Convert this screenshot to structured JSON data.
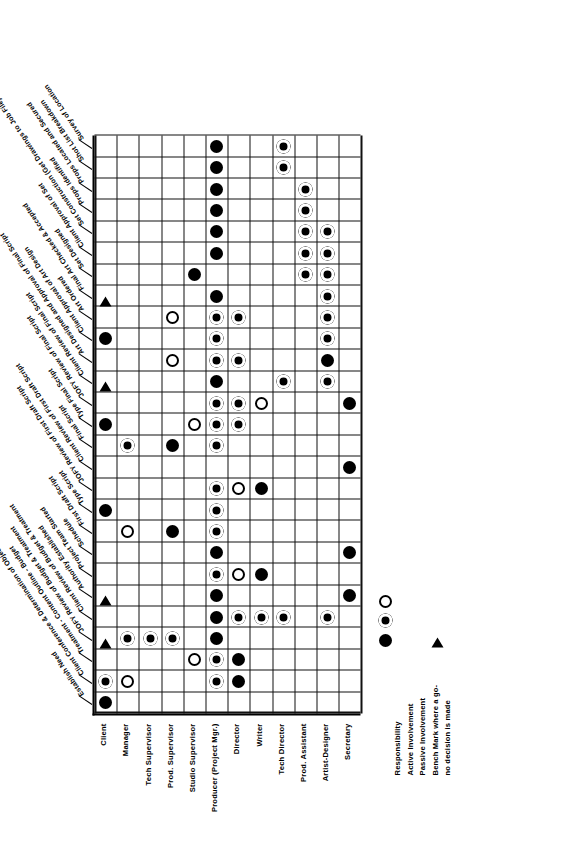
{
  "document": {
    "kind": "linear-responsibility-chart",
    "orientation": "rotated-90-ccw"
  },
  "legend": {
    "items": [
      {
        "symbol": "filled-circle",
        "label": "Responsibility"
      },
      {
        "symbol": "dotted-circle",
        "label": "Active Involvement"
      },
      {
        "symbol": "open-circle",
        "label": "Passive Involvement"
      },
      {
        "symbol": "triangle",
        "label": "Bench Mark where a go-"
      },
      {
        "symbol": "none",
        "label": "no decision is made"
      }
    ]
  },
  "roles": [
    "Client",
    "Manager",
    "Tech Supervisor",
    "Prod. Supervisor",
    "Studio Supervisor",
    "Producer (Project Mgr.)",
    "Director",
    "Writer",
    "Tech Director",
    "Prod. Assistant",
    "Artist-Designer",
    "Secretary"
  ],
  "tasks": [
    "Establish Need",
    "Client Conference & Determination of Objectives",
    "Treatment - Content Outline - Budget",
    "JOFY Review of Budget & Treatment",
    "Client Review of Budget & Treatment",
    "Authority Established",
    "Project Team Started",
    "Schedule",
    "First Draft Script",
    "Type Script",
    "JOFY Review of First Draft Script",
    "Client Review of First Draft Script",
    "Final Script",
    "Type Final Script",
    "JOFY Review of Final Script",
    "Client Review of Final Script",
    "Art Designed and Approval of Final Script",
    "Client Approval of Art Design",
    "Art Ordered",
    "Final Art Checked & Accepted",
    "Set Designed",
    "Client Approval of Set",
    "Set Construction (Get Drawings to Job File)",
    "Props Identified",
    "Props Located and Secured",
    "Shot List Breakdown",
    "Survey of Location"
  ],
  "chart_data": {
    "type": "table",
    "xlabel": "Task",
    "ylabel": "Role",
    "symbol_key": {
      "R": "Responsibility",
      "A": "Active Involvement",
      "P": "Passive Involvement",
      "B": "Bench Mark where a go-no go decision is made"
    },
    "cells": [
      {
        "task": 0,
        "role": 0,
        "mark": "R"
      },
      {
        "task": 1,
        "role": 0,
        "mark": "A"
      },
      {
        "task": 1,
        "role": 1,
        "mark": "P"
      },
      {
        "task": 1,
        "role": 5,
        "mark": "A"
      },
      {
        "task": 1,
        "role": 6,
        "mark": "R"
      },
      {
        "task": 2,
        "role": 5,
        "mark": "A"
      },
      {
        "task": 2,
        "role": 6,
        "mark": "R"
      },
      {
        "task": 2,
        "role": 4,
        "mark": "P"
      },
      {
        "task": 3,
        "role": 0,
        "mark": "B"
      },
      {
        "task": 3,
        "role": 1,
        "mark": "A"
      },
      {
        "task": 3,
        "role": 2,
        "mark": "A"
      },
      {
        "task": 3,
        "role": 3,
        "mark": "A"
      },
      {
        "task": 3,
        "role": 5,
        "mark": "R"
      },
      {
        "task": 4,
        "role": 5,
        "mark": "R"
      },
      {
        "task": 4,
        "role": 6,
        "mark": "A"
      },
      {
        "task": 4,
        "role": 7,
        "mark": "A"
      },
      {
        "task": 4,
        "role": 8,
        "mark": "A"
      },
      {
        "task": 4,
        "role": 10,
        "mark": "A"
      },
      {
        "task": 5,
        "role": 0,
        "mark": "B"
      },
      {
        "task": 5,
        "role": 5,
        "mark": "R"
      },
      {
        "task": 5,
        "role": 11,
        "mark": "R"
      },
      {
        "task": 6,
        "role": 5,
        "mark": "A"
      },
      {
        "task": 6,
        "role": 6,
        "mark": "P"
      },
      {
        "task": 6,
        "role": 7,
        "mark": "R"
      },
      {
        "task": 7,
        "role": 5,
        "mark": "R"
      },
      {
        "task": 7,
        "role": 11,
        "mark": "R"
      },
      {
        "task": 8,
        "role": 5,
        "mark": "A"
      },
      {
        "task": 8,
        "role": 3,
        "mark": "R"
      },
      {
        "task": 8,
        "role": 1,
        "mark": "P"
      },
      {
        "task": 9,
        "role": 5,
        "mark": "A"
      },
      {
        "task": 9,
        "role": 0,
        "mark": "R"
      },
      {
        "task": 10,
        "role": 5,
        "mark": "A"
      },
      {
        "task": 10,
        "role": 6,
        "mark": "P"
      },
      {
        "task": 10,
        "role": 7,
        "mark": "R"
      },
      {
        "task": 11,
        "role": 11,
        "mark": "R"
      },
      {
        "task": 12,
        "role": 5,
        "mark": "A"
      },
      {
        "task": 12,
        "role": 3,
        "mark": "R"
      },
      {
        "task": 12,
        "role": 1,
        "mark": "A"
      },
      {
        "task": 13,
        "role": 0,
        "mark": "R"
      },
      {
        "task": 13,
        "role": 5,
        "mark": "A"
      },
      {
        "task": 13,
        "role": 4,
        "mark": "P"
      },
      {
        "task": 13,
        "role": 6,
        "mark": "A"
      },
      {
        "task": 14,
        "role": 5,
        "mark": "A"
      },
      {
        "task": 14,
        "role": 6,
        "mark": "A"
      },
      {
        "task": 14,
        "role": 7,
        "mark": "P"
      },
      {
        "task": 14,
        "role": 11,
        "mark": "R"
      },
      {
        "task": 15,
        "role": 0,
        "mark": "B"
      },
      {
        "task": 15,
        "role": 5,
        "mark": "R"
      },
      {
        "task": 15,
        "role": 8,
        "mark": "A"
      },
      {
        "task": 15,
        "role": 10,
        "mark": "A"
      },
      {
        "task": 16,
        "role": 3,
        "mark": "P"
      },
      {
        "task": 16,
        "role": 5,
        "mark": "A"
      },
      {
        "task": 16,
        "role": 6,
        "mark": "A"
      },
      {
        "task": 16,
        "role": 10,
        "mark": "R"
      },
      {
        "task": 17,
        "role": 0,
        "mark": "R"
      },
      {
        "task": 17,
        "role": 5,
        "mark": "A"
      },
      {
        "task": 17,
        "role": 10,
        "mark": "A"
      },
      {
        "task": 18,
        "role": 3,
        "mark": "P"
      },
      {
        "task": 18,
        "role": 5,
        "mark": "A"
      },
      {
        "task": 18,
        "role": 6,
        "mark": "A"
      },
      {
        "task": 18,
        "role": 10,
        "mark": "A"
      },
      {
        "task": 19,
        "role": 0,
        "mark": "B"
      },
      {
        "task": 19,
        "role": 5,
        "mark": "R"
      },
      {
        "task": 19,
        "role": 10,
        "mark": "A"
      },
      {
        "task": 20,
        "role": 4,
        "mark": "R"
      },
      {
        "task": 20,
        "role": 9,
        "mark": "A"
      },
      {
        "task": 20,
        "role": 10,
        "mark": "A"
      },
      {
        "task": 21,
        "role": 5,
        "mark": "R"
      },
      {
        "task": 21,
        "role": 9,
        "mark": "A"
      },
      {
        "task": 21,
        "role": 10,
        "mark": "A"
      },
      {
        "task": 22,
        "role": 5,
        "mark": "R"
      },
      {
        "task": 22,
        "role": 9,
        "mark": "A"
      },
      {
        "task": 22,
        "role": 10,
        "mark": "A"
      },
      {
        "task": 23,
        "role": 5,
        "mark": "R"
      },
      {
        "task": 23,
        "role": 9,
        "mark": "A"
      },
      {
        "task": 24,
        "role": 5,
        "mark": "R"
      },
      {
        "task": 24,
        "role": 9,
        "mark": "A"
      },
      {
        "task": 25,
        "role": 5,
        "mark": "R"
      },
      {
        "task": 25,
        "role": 8,
        "mark": "A"
      },
      {
        "task": 26,
        "role": 5,
        "mark": "R"
      },
      {
        "task": 26,
        "role": 8,
        "mark": "A"
      }
    ]
  }
}
